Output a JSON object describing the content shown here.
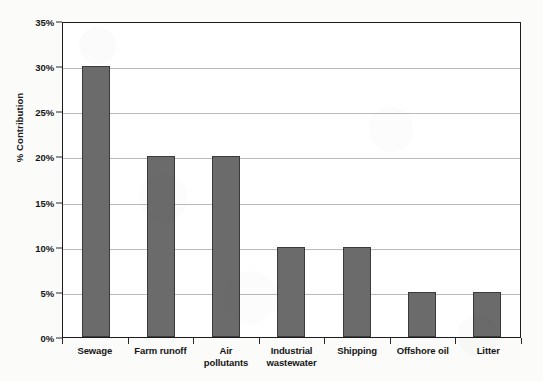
{
  "chart_data": {
    "type": "bar",
    "title": "",
    "subtitle": "",
    "xlabel": "",
    "ylabel": "% Contribution",
    "ylim": [
      0,
      35
    ],
    "ytick_values": [
      35,
      30,
      25,
      20,
      15,
      10,
      5,
      0
    ],
    "ytick_labels": [
      "35%",
      "30%",
      "25%",
      "20%",
      "15%",
      "10%",
      "5%",
      "0%"
    ],
    "grid": "horizontal",
    "legend": "none",
    "categories": [
      "Sewage",
      "Farm runoff",
      "Air pollutants",
      "Industrial wastewater",
      "Shipping",
      "Offshore oil",
      "Litter"
    ],
    "category_label_lines": [
      [
        "Sewage"
      ],
      [
        "Farm runoff"
      ],
      [
        "Air",
        "pollutants"
      ],
      [
        "Industrial",
        "wastewater"
      ],
      [
        "Shipping"
      ],
      [
        "Offshore oil"
      ],
      [
        "Litter"
      ]
    ],
    "values": [
      30,
      20,
      20,
      10,
      10,
      5,
      5
    ],
    "colors": {
      "bar_fill": "#6b6b6b",
      "bar_edge": "#3a3a3a",
      "gridline": "#b9b9b9",
      "frame": "#1c1c1c",
      "plot_background": "#ffffff",
      "figure_background": "#fbfbfa",
      "text": "#151515"
    }
  }
}
